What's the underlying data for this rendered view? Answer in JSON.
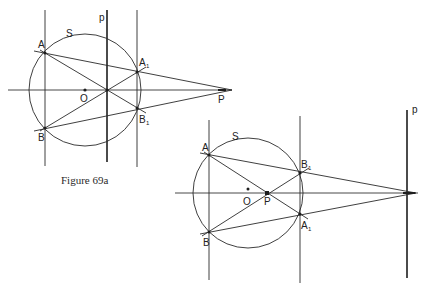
{
  "figure_a": {
    "caption": "Figure 69a",
    "labels": {
      "circle": "S",
      "polar": "p",
      "center": "O",
      "pole": "P",
      "A": "A",
      "A1": "A",
      "A1_sub": "1",
      "B": "B",
      "B1": "B",
      "B1_sub": "1"
    }
  },
  "figure_b": {
    "labels": {
      "circle": "S",
      "polar": "p",
      "center": "O",
      "pole": "P",
      "A": "A",
      "A1": "A",
      "A1_sub": "1",
      "B": "B",
      "B1": "B",
      "B1_sub": "1"
    }
  },
  "colors": {
    "stroke": "#2a2a2a",
    "background": "#ffffff"
  }
}
